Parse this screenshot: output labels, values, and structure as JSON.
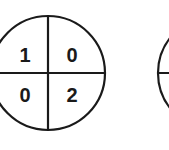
{
  "diagrams": [
    {
      "id": "circle-1",
      "quadrants": {
        "top_left": "1",
        "top_right": "0",
        "bottom_left": "0",
        "bottom_right": "2"
      }
    },
    {
      "id": "circle-2",
      "quadrants": {}
    }
  ],
  "colors": {
    "stroke": "#1a1a1a",
    "background": "#ffffff"
  }
}
